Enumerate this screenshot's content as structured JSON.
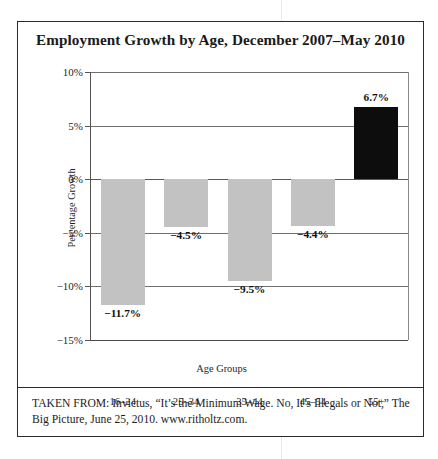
{
  "figure": {
    "title": "Employment Growth by Age, December 2007–May 2010",
    "caption": "TAKEN FROM: Invictus, “It’s the Minimum Wage. No, It’s Illegals or Not,” The Big Picture, June 25, 2010. www.ritholtz.com."
  },
  "colors": {
    "negative_bar": "#c2c2c2",
    "positive_bar": "#0d0d0d",
    "frame": "#2b2b2b",
    "gridline": "#6f6f6f",
    "text": "#1a1a1a"
  },
  "chart_data": {
    "type": "bar",
    "title": "Employment Growth by Age, December 2007–May 2010",
    "xlabel": "Age Groups",
    "ylabel": "Percentage Growth",
    "categories": [
      "16–24",
      "25–34",
      "35–44",
      "45–54",
      "55+"
    ],
    "values": [
      -11.7,
      -4.5,
      -9.5,
      -4.4,
      6.7
    ],
    "data_labels": [
      "−11.7%",
      "−4.5%",
      "−9.5%",
      "−4.4%",
      "6.7%"
    ],
    "ylim": [
      -15,
      10
    ],
    "ytick_values": [
      10,
      5,
      0,
      -5,
      -10,
      -15
    ],
    "ytick_labels": [
      "10%",
      "5%",
      "0%",
      "−5%",
      "−10%",
      "−15%"
    ],
    "grid": true,
    "legend": "none",
    "bar_colors": [
      "#c2c2c2",
      "#c2c2c2",
      "#c2c2c2",
      "#c2c2c2",
      "#0d0d0d"
    ],
    "units": "percent"
  }
}
